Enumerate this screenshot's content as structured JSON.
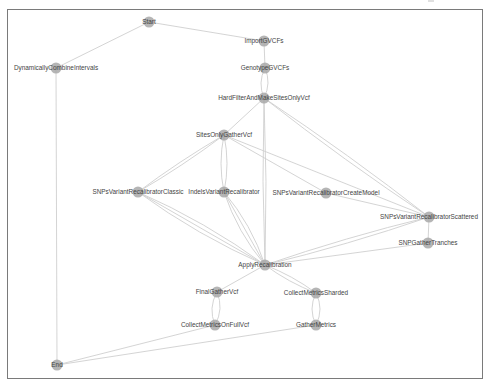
{
  "graph": {
    "title": "Workflow DAG",
    "colors": {
      "node": "#a8a8a8",
      "edge": "#cfcfcf",
      "label": "#444444",
      "frame": "#7a7a7a"
    },
    "nodes": [
      {
        "id": "start",
        "label": "Start",
        "x": 149,
        "y": 22
      },
      {
        "id": "import",
        "label": "ImportGVCFs",
        "x": 264,
        "y": 41
      },
      {
        "id": "dci",
        "label": "DynamicallyCombineIntervals",
        "x": 56,
        "y": 68
      },
      {
        "id": "genotype",
        "label": "GenotypeGVCFs",
        "x": 265,
        "y": 68
      },
      {
        "id": "hardfilter",
        "label": "HardFilterAndMakeSitesOnlyVcf",
        "x": 264,
        "y": 98
      },
      {
        "id": "sitesonly",
        "label": "SitesOnlyGatherVcf",
        "x": 224,
        "y": 135
      },
      {
        "id": "snpclassic",
        "label": "SNPsVariantRecalibratorClassic",
        "x": 138,
        "y": 192
      },
      {
        "id": "indels",
        "label": "IndelsVariantRecalibrator",
        "x": 224,
        "y": 192
      },
      {
        "id": "snpcreate",
        "label": "SNPsVariantRecalibratorCreateModel",
        "x": 326,
        "y": 193
      },
      {
        "id": "snpscattered",
        "label": "SNPsVariantRecalibratorScattered",
        "x": 429,
        "y": 217
      },
      {
        "id": "snpgather",
        "label": "SNPGatherTranches",
        "x": 428,
        "y": 243
      },
      {
        "id": "apply",
        "label": "ApplyRecalibration",
        "x": 265,
        "y": 265
      },
      {
        "id": "finalgather",
        "label": "FinalGatherVcf",
        "x": 217,
        "y": 292
      },
      {
        "id": "cmsharded",
        "label": "CollectMetricsSharded",
        "x": 316,
        "y": 293
      },
      {
        "id": "cmfull",
        "label": "CollectMetricsOnFullVcf",
        "x": 215,
        "y": 325
      },
      {
        "id": "gathermetrics",
        "label": "GatherMetrics",
        "x": 316,
        "y": 325
      },
      {
        "id": "end",
        "label": "End",
        "x": 57,
        "y": 365
      }
    ],
    "edges": [
      {
        "from": "start",
        "to": "dci"
      },
      {
        "from": "start",
        "to": "import"
      },
      {
        "from": "import",
        "to": "genotype"
      },
      {
        "from": "genotype",
        "to": "hardfilter",
        "curve": -7
      },
      {
        "from": "genotype",
        "to": "hardfilter",
        "curve": 7
      },
      {
        "from": "dci",
        "to": "end"
      },
      {
        "from": "hardfilter",
        "to": "sitesonly"
      },
      {
        "from": "hardfilter",
        "to": "apply",
        "curve": -3
      },
      {
        "from": "hardfilter",
        "to": "apply",
        "curve": 3
      },
      {
        "from": "hardfilter",
        "to": "snpscattered",
        "curve": -4
      },
      {
        "from": "hardfilter",
        "to": "snpscattered",
        "curve": 4
      },
      {
        "from": "sitesonly",
        "to": "snpclassic",
        "curve": -3
      },
      {
        "from": "sitesonly",
        "to": "snpclassic",
        "curve": 3
      },
      {
        "from": "sitesonly",
        "to": "indels",
        "curve": -6
      },
      {
        "from": "sitesonly",
        "to": "indels",
        "curve": 6
      },
      {
        "from": "sitesonly",
        "to": "snpcreate"
      },
      {
        "from": "sitesonly",
        "to": "snpscattered"
      },
      {
        "from": "snpcreate",
        "to": "snpscattered"
      },
      {
        "from": "snpclassic",
        "to": "apply",
        "curve": -8
      },
      {
        "from": "snpclassic",
        "to": "apply",
        "curve": 0
      },
      {
        "from": "snpclassic",
        "to": "apply",
        "curve": 8
      },
      {
        "from": "indels",
        "to": "apply",
        "curve": -8
      },
      {
        "from": "indels",
        "to": "apply",
        "curve": 0
      },
      {
        "from": "indels",
        "to": "apply",
        "curve": 8
      },
      {
        "from": "snpscattered",
        "to": "snpgather"
      },
      {
        "from": "snpscattered",
        "to": "apply",
        "curve": -4
      },
      {
        "from": "snpscattered",
        "to": "apply",
        "curve": 4
      },
      {
        "from": "snpgather",
        "to": "apply"
      },
      {
        "from": "apply",
        "to": "finalgather"
      },
      {
        "from": "apply",
        "to": "cmsharded",
        "curve": -4
      },
      {
        "from": "apply",
        "to": "cmsharded",
        "curve": 4
      },
      {
        "from": "finalgather",
        "to": "cmfull",
        "curve": -8
      },
      {
        "from": "finalgather",
        "to": "cmfull",
        "curve": 8
      },
      {
        "from": "cmsharded",
        "to": "gathermetrics",
        "curve": -8
      },
      {
        "from": "cmsharded",
        "to": "gathermetrics",
        "curve": 8
      },
      {
        "from": "cmfull",
        "to": "end"
      },
      {
        "from": "gathermetrics",
        "to": "end"
      }
    ]
  }
}
